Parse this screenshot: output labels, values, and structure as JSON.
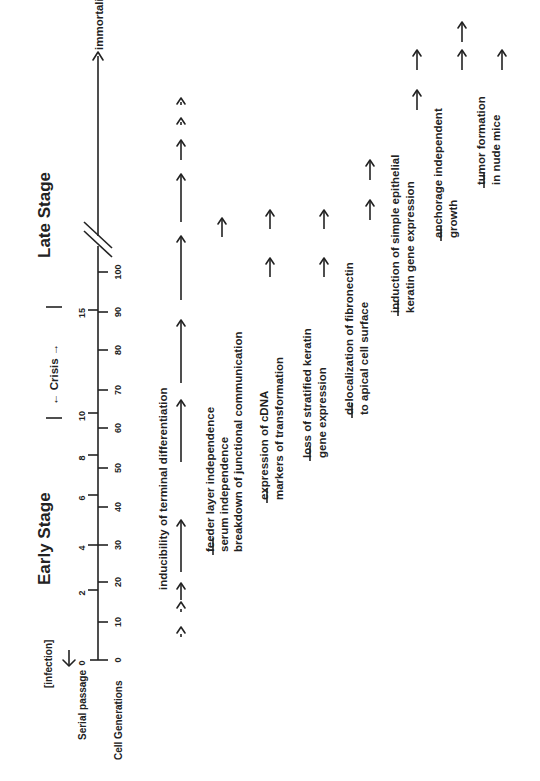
{
  "diagram": {
    "orientation": "rotated 90 degrees counter-clockwise",
    "stages": {
      "early": "Early Stage",
      "crisis": "Crisis",
      "late": "Late Stage"
    },
    "infection_label": "[infection]",
    "axes": {
      "serial_passage_label": "Serial passage",
      "cell_generations_label": "Cell Generations",
      "serial_passage_ticks": [
        "0",
        "2",
        "4",
        "6",
        "8",
        "10",
        "15"
      ],
      "cell_generation_ticks": [
        "0",
        "10",
        "20",
        "30",
        "40",
        "50",
        "60",
        "70",
        "80",
        "90",
        "100"
      ],
      "end_label": "immortalization"
    },
    "rows": [
      {
        "lines": [
          "inducibility of terminal differentiation"
        ]
      },
      {
        "lines": [
          "feeder layer independence",
          "serum independence",
          "breakdown of junctional communication"
        ]
      },
      {
        "lines": [
          "expression of cDNA",
          "markers of transformation"
        ]
      },
      {
        "lines": [
          "loss of stratified keratin",
          "gene expression"
        ]
      },
      {
        "lines": [
          "delocalization of fibronectin",
          "to apical cell surface"
        ]
      },
      {
        "lines": [
          "induction of simple epithelial",
          "keratin gene expression"
        ]
      },
      {
        "lines": [
          "anchorage independent",
          "growth"
        ]
      },
      {
        "lines": [
          "tumor formation",
          "in nude mice"
        ]
      }
    ]
  }
}
